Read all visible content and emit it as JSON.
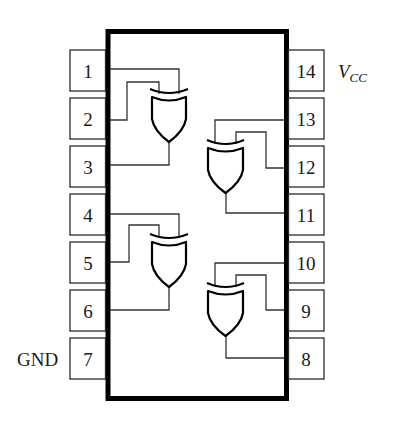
{
  "diagram": {
    "type": "ic-pinout",
    "colors": {
      "background": "#ffffff",
      "stroke": "#000000",
      "wire": "#333333"
    },
    "left_pins": [
      {
        "number": "1",
        "label": ""
      },
      {
        "number": "2",
        "label": ""
      },
      {
        "number": "3",
        "label": ""
      },
      {
        "number": "4",
        "label": ""
      },
      {
        "number": "5",
        "label": ""
      },
      {
        "number": "6",
        "label": ""
      },
      {
        "number": "7",
        "label": "GND"
      }
    ],
    "right_pins": [
      {
        "number": "14",
        "label": "V",
        "label_sub": "CC"
      },
      {
        "number": "13",
        "label": ""
      },
      {
        "number": "12",
        "label": ""
      },
      {
        "number": "11",
        "label": ""
      },
      {
        "number": "10",
        "label": ""
      },
      {
        "number": "9",
        "label": ""
      },
      {
        "number": "8",
        "label": ""
      }
    ],
    "gates": [
      {
        "id": "gate-1",
        "type": "XOR",
        "inputs": [
          "1",
          "2"
        ],
        "output": "3"
      },
      {
        "id": "gate-2",
        "type": "XOR",
        "inputs": [
          "13",
          "12"
        ],
        "output": "11"
      },
      {
        "id": "gate-3",
        "type": "XOR",
        "inputs": [
          "4",
          "5"
        ],
        "output": "6"
      },
      {
        "id": "gate-4",
        "type": "XOR",
        "inputs": [
          "10",
          "9"
        ],
        "output": "8"
      }
    ]
  }
}
